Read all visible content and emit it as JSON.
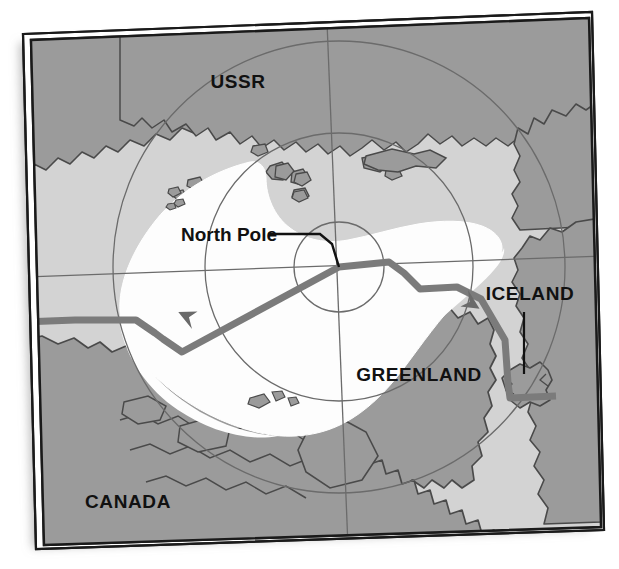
{
  "figure": {
    "kind": "map",
    "projection": "polar azimuthal",
    "rotation_deg": -2.2,
    "frame": {
      "style": "double-rule",
      "outer_color": "#1a1a1a",
      "inner_color": "#1a1a1a",
      "gap_color": "#ffffff",
      "shadow_color": "#c9c9c9"
    }
  },
  "palette": {
    "ocean": "#d3d3d3",
    "land": "#9b9b9b",
    "ice": "#fdfdfd",
    "coastline": "#4a4a4a",
    "graticule": "#6b6b6b",
    "route": "#7b7b7b",
    "route_dark": "#6a6a6a",
    "leader": "#111111",
    "text": "#111111",
    "page": "#ffffff"
  },
  "labels": [
    {
      "id": "ussr",
      "text": "USSR",
      "type": "country",
      "x": 238,
      "y": 88,
      "anchor": "middle",
      "leader": false
    },
    {
      "id": "greenland",
      "text": "GREENLAND",
      "type": "country",
      "x": 419,
      "y": 380,
      "anchor": "middle",
      "leader": false
    },
    {
      "id": "iceland",
      "text": "ICELAND",
      "type": "country",
      "x": 530,
      "y": 299,
      "anchor": "middle",
      "leader": true
    },
    {
      "id": "canada",
      "text": "CANADA",
      "type": "country",
      "x": 128,
      "y": 507,
      "anchor": "middle",
      "leader": false
    },
    {
      "id": "north-pole",
      "text": "North Pole",
      "type": "point",
      "x": 181,
      "y": 240,
      "anchor": "start",
      "leader": true
    }
  ],
  "leader_lines": [
    {
      "id": "north-pole-leader",
      "for": "north-pole",
      "points": "268,234 318,234 330,242 339,267",
      "color": "#111111",
      "width": 2.4
    },
    {
      "id": "iceland-leader",
      "for": "iceland",
      "points": "524,310 524,372",
      "color": "#111111",
      "width": 2.2
    }
  ],
  "graticule": {
    "latitude_circles": [
      {
        "id": "inner-circle",
        "cx": 339,
        "cy": 267,
        "r": 45
      },
      {
        "id": "middle-circle",
        "cx": 339,
        "cy": 267,
        "r": 134
      },
      {
        "id": "outer-circle",
        "cx": 339,
        "cy": 267,
        "r": 226
      }
    ],
    "meridians": [
      {
        "id": "meridian-horizontal",
        "x1": 24,
        "y1": 277,
        "x2": 600,
        "y2": 256
      },
      {
        "id": "meridian-vertical",
        "x1": 327,
        "y1": 24,
        "x2": 348,
        "y2": 545
      }
    ]
  },
  "route": {
    "name": "polar flight route",
    "color": "#7b7b7b",
    "width": 7,
    "points": "24,322 75,320 136,320 155,333 163,339 182,352 339,267 389,262 404,273 420,289 457,287 481,299 505,340 508,383 510,398 556,396",
    "arrows": [
      {
        "id": "arrow-west",
        "x": 200,
        "y": 335,
        "angle": 208,
        "note": "arrowhead pointing toward Canada"
      },
      {
        "id": "arrow-iceland",
        "x": 479,
        "y": 297,
        "angle": 52,
        "note": "arrowhead pointing toward Iceland"
      }
    ]
  },
  "geography": {
    "ice_cap_note": "white sea-ice region centred on the North Pole",
    "landmasses": [
      "USSR",
      "GREENLAND",
      "ICELAND",
      "CANADA"
    ]
  }
}
